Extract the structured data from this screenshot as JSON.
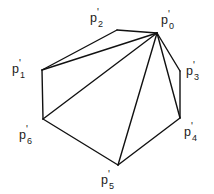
{
  "figure": {
    "background_color": "#ffffff",
    "stroke_color": "#111111",
    "stroke_width": 1.4,
    "width": 214,
    "height": 194,
    "vertices": [
      {
        "id": "p0",
        "base": "p",
        "prime": "'",
        "subscript": "0",
        "x": 157,
        "y": 33,
        "label_x": 161,
        "label_y": 11
      },
      {
        "id": "p1",
        "base": "p",
        "prime": "'",
        "subscript": "1",
        "x": 42,
        "y": 70,
        "label_x": 12,
        "label_y": 60
      },
      {
        "id": "p2",
        "base": "p",
        "prime": "'",
        "subscript": "2",
        "x": 117,
        "y": 30,
        "label_x": 90,
        "label_y": 9
      },
      {
        "id": "p3",
        "base": "p",
        "prime": "'",
        "subscript": "3",
        "x": 180,
        "y": 71,
        "label_x": 186,
        "label_y": 62
      },
      {
        "id": "p4",
        "base": "p",
        "prime": "'",
        "subscript": "4",
        "x": 180,
        "y": 118,
        "label_x": 184,
        "label_y": 123
      },
      {
        "id": "p5",
        "base": "p",
        "prime": "'",
        "subscript": "5",
        "x": 118,
        "y": 165,
        "label_x": 101,
        "label_y": 171
      },
      {
        "id": "p6",
        "base": "p",
        "prime": "'",
        "subscript": "6",
        "x": 43,
        "y": 119,
        "label_x": 19,
        "label_y": 126
      }
    ],
    "boundary_edges": [
      {
        "name": "edge-p0-p2",
        "from": "p0",
        "to": "p2"
      },
      {
        "name": "edge-p2-p1",
        "from": "p2",
        "to": "p1"
      },
      {
        "name": "edge-p1-p6",
        "from": "p1",
        "to": "p6"
      },
      {
        "name": "edge-p6-p5",
        "from": "p6",
        "to": "p5"
      },
      {
        "name": "edge-p5-p4",
        "from": "p5",
        "to": "p4"
      },
      {
        "name": "edge-p4-p3",
        "from": "p4",
        "to": "p3"
      },
      {
        "name": "edge-p3-p0",
        "from": "p3",
        "to": "p0"
      }
    ],
    "diagonal_edges": [
      {
        "name": "diagonal-p0-p1",
        "from": "p0",
        "to": "p1"
      },
      {
        "name": "diagonal-p0-p6",
        "from": "p0",
        "to": "p6"
      },
      {
        "name": "diagonal-p0-p5",
        "from": "p0",
        "to": "p5"
      },
      {
        "name": "diagonal-p0-p4",
        "from": "p0",
        "to": "p4"
      }
    ]
  }
}
